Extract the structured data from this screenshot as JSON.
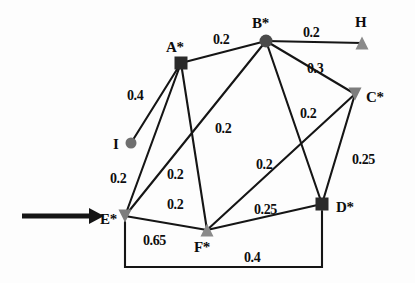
{
  "figure": {
    "type": "weighted-undirected-graph",
    "background_color": "#fdfdfd",
    "edge_color": "#151515",
    "text_color": "#0d0d0d",
    "dark_node_color": "#2a2a2a",
    "gray_node_color": "#8a8a8a"
  },
  "pointer": {
    "name": "entry-arrow",
    "label": "",
    "points_to": "E*",
    "x1": 22,
    "y1": 216,
    "x2": 104,
    "y2": 216
  },
  "nodes": [
    {
      "id": "A",
      "label": "A*",
      "shape": "square",
      "fill": "#2a2a2a",
      "x": 181,
      "y": 63,
      "size": 13,
      "label_x": 166,
      "label_y": 40
    },
    {
      "id": "B",
      "label": "B*",
      "shape": "circle",
      "fill": "#4a4a4a",
      "x": 266,
      "y": 41,
      "size": 13,
      "label_x": 252,
      "label_y": 16
    },
    {
      "id": "C",
      "label": "C*",
      "shape": "triangle-down",
      "fill": "#7d7d7d",
      "x": 355,
      "y": 94,
      "size": 13,
      "label_x": 366,
      "label_y": 90
    },
    {
      "id": "D",
      "label": "D*",
      "shape": "square",
      "fill": "#2a2a2a",
      "x": 322,
      "y": 204,
      "size": 13,
      "label_x": 336,
      "label_y": 200
    },
    {
      "id": "E",
      "label": "E*",
      "shape": "triangle-down",
      "fill": "#7d7d7d",
      "x": 125,
      "y": 216,
      "size": 13,
      "label_x": 100,
      "label_y": 212
    },
    {
      "id": "F",
      "label": "F*",
      "shape": "triangle-up",
      "fill": "#8a8a8a",
      "x": 207,
      "y": 230,
      "size": 13,
      "label_x": 194,
      "label_y": 240
    },
    {
      "id": "H",
      "label": "H",
      "shape": "triangle-up",
      "fill": "#8a8a8a",
      "x": 362,
      "y": 43,
      "size": 13,
      "label_x": 355,
      "label_y": 15
    },
    {
      "id": "I",
      "label": "I",
      "shape": "circle",
      "fill": "#6f6f6f",
      "x": 131,
      "y": 143,
      "size": 11,
      "label_x": 113,
      "label_y": 137
    }
  ],
  "edges": [
    {
      "from": "A",
      "to": "B",
      "weight": "0.2",
      "label_x": 213,
      "label_y": 33
    },
    {
      "from": "B",
      "to": "H",
      "weight": "0.2",
      "label_x": 303,
      "label_y": 26
    },
    {
      "from": "B",
      "to": "C",
      "weight": "0.3",
      "label_x": 307,
      "label_y": 62
    },
    {
      "from": "I",
      "to": "A",
      "weight": "0.4",
      "label_x": 127,
      "label_y": 89
    },
    {
      "from": "A",
      "to": "E",
      "weight": "0.2",
      "label_x": 110,
      "label_y": 172
    },
    {
      "from": "A",
      "to": "F",
      "weight": "0.2",
      "label_x": 167,
      "label_y": 168
    },
    {
      "from": "B",
      "to": "E",
      "weight": "0.2",
      "label_x": 215,
      "label_y": 122
    },
    {
      "from": "B",
      "to": "D",
      "weight": "0.2",
      "label_x": 300,
      "label_y": 107
    },
    {
      "from": "C",
      "to": "F",
      "weight": "0.2",
      "label_x": 256,
      "label_y": 158
    },
    {
      "from": "C",
      "to": "D",
      "weight": "0.25",
      "label_x": 352,
      "label_y": 153
    },
    {
      "from": "E",
      "to": "F",
      "weight": "0.65",
      "label_x": 143,
      "label_y": 234
    },
    {
      "from": "F",
      "to": "D",
      "weight": "0.25",
      "label_x": 254,
      "label_y": 203
    },
    {
      "from": "E",
      "to": "D",
      "weight": "0.4",
      "label_x": 244,
      "label_y": 251
    },
    {
      "from": "E",
      "to": "F",
      "weight": "0.2",
      "label_x": 167,
      "label_y": 198,
      "variant": "inner"
    }
  ],
  "chart_data": {
    "type": "diagram",
    "title": "",
    "node_ids": [
      "A*",
      "B*",
      "C*",
      "D*",
      "E*",
      "F*",
      "H",
      "I"
    ],
    "edge_list": [
      [
        "A*",
        "B*",
        0.2
      ],
      [
        "B*",
        "H",
        0.2
      ],
      [
        "B*",
        "C*",
        0.3
      ],
      [
        "I",
        "A*",
        0.4
      ],
      [
        "A*",
        "E*",
        0.2
      ],
      [
        "A*",
        "F*",
        0.2
      ],
      [
        "B*",
        "E*",
        0.2
      ],
      [
        "B*",
        "D*",
        0.2
      ],
      [
        "C*",
        "F*",
        0.2
      ],
      [
        "C*",
        "D*",
        0.25
      ],
      [
        "E*",
        "F*",
        0.65
      ],
      [
        "F*",
        "D*",
        0.25
      ],
      [
        "E*",
        "D*",
        0.4
      ]
    ]
  }
}
